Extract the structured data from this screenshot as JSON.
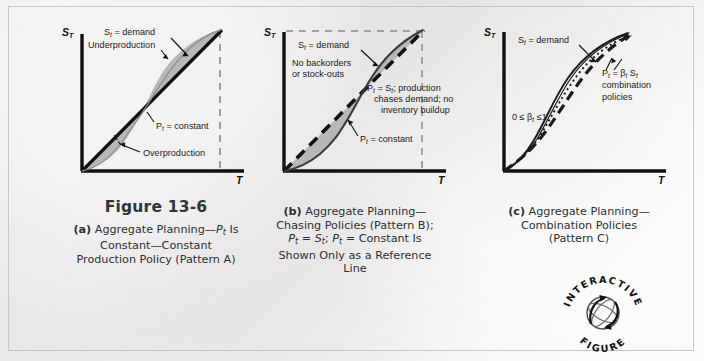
{
  "figure": {
    "title": "Figure 13-6",
    "background_color": "#ecebea",
    "border_color": "#c9c6c3",
    "shade_color": "#b9b9b9",
    "line_color": "#111111"
  },
  "panels": [
    {
      "id": "a",
      "name": "aggregate-planning-constant-production",
      "axis": {
        "y_label": "S",
        "y_sub": "T",
        "x_label": "T"
      },
      "annotations": [
        {
          "name": "demand-label",
          "text": "Sₜ = demand"
        },
        {
          "name": "underproduction-label",
          "text": "Underproduction"
        },
        {
          "name": "constant-production-label",
          "text": "Pₜ = constant"
        },
        {
          "name": "overproduction-label",
          "text": "Overproduction"
        }
      ],
      "caption_lines": [
        "(a) Aggregate Planning—Pₜ Is",
        "Constant—Constant",
        "Production Policy (Pattern A)"
      ]
    },
    {
      "id": "b",
      "name": "aggregate-planning-chasing-policies",
      "axis": {
        "y_label": "S",
        "y_sub": "T",
        "x_label": "T"
      },
      "annotations": [
        {
          "name": "demand-label",
          "text": "Sₜ = demand"
        },
        {
          "name": "no-backorders-label-1",
          "text": "No backorders"
        },
        {
          "name": "no-backorders-label-2",
          "text": "or stock-outs"
        },
        {
          "name": "chase-demand-label-1",
          "text": "Pₜ = Sₜ; production"
        },
        {
          "name": "chase-demand-label-2",
          "text": "chases demand; no"
        },
        {
          "name": "chase-demand-label-3",
          "text": "inventory buildup"
        },
        {
          "name": "constant-production-label",
          "text": "Pₜ = constant"
        }
      ],
      "caption_lines": [
        "(b) Aggregate Planning—",
        "Chasing Policies (Pattern B);",
        "Pₜ = Sₜ; Pₜ = Constant Is",
        "Shown Only as a Reference",
        "Line"
      ]
    },
    {
      "id": "c",
      "name": "aggregate-planning-combination-policies",
      "axis": {
        "y_label": "S",
        "y_sub": "T",
        "x_label": "T"
      },
      "annotations": [
        {
          "name": "demand-label",
          "text": "Sₜ = demand"
        },
        {
          "name": "beta-range-label",
          "text": "0 ≤ βₜ ≤ 1"
        },
        {
          "name": "combination-label-1",
          "text": "Pₜ = βₜ Sₜ"
        },
        {
          "name": "combination-label-2",
          "text": "combination"
        },
        {
          "name": "combination-label-3",
          "text": "policies"
        }
      ],
      "caption_lines": [
        "(c) Aggregate Planning—",
        "Combination Policies",
        "(Pattern C)"
      ]
    }
  ],
  "stamp": {
    "name": "interactive-figure-stamp",
    "top_text": "INTERACTIVE",
    "bottom_text": "FIGURE"
  }
}
